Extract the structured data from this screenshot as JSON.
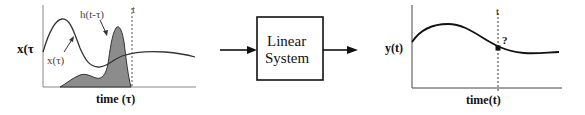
{
  "left_plot": {
    "y_label": "x(τ",
    "x_label": "time (τ)",
    "input_curve_label": "x(τ)",
    "kernel_label": "h(t-τ)",
    "marker_label": "t"
  },
  "system_block": {
    "line1": "Linear",
    "line2": "System"
  },
  "right_plot": {
    "y_label": "y(t)",
    "x_label": "time(t)",
    "marker_label": "t",
    "query_label": "?"
  },
  "colors": {
    "stroke": "#1a1a1a",
    "fill_shaded": "#8c8c8c",
    "dashed": "#555555"
  }
}
